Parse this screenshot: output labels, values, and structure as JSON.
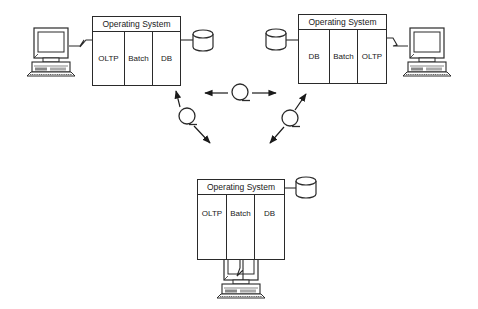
{
  "diagram": {
    "type": "distributed-systems-network",
    "nodes": [
      {
        "id": "node-top-left",
        "header": "Operating System",
        "columns": [
          "OLTP",
          "Batch",
          "DB"
        ]
      },
      {
        "id": "node-top-right",
        "header": "Operating System",
        "columns": [
          "DB",
          "Batch",
          "OLTP"
        ]
      },
      {
        "id": "node-bottom",
        "header": "Operating System",
        "columns": [
          "OLTP",
          "Batch",
          "DB"
        ]
      }
    ],
    "icons": {
      "terminal": "computer-terminal-icon",
      "database": "database-cylinder-icon",
      "network_link": "communication-loop-icon"
    },
    "connections": [
      {
        "from": "node-top-left",
        "to": "node-top-right",
        "style": "bidirectional-arrow-with-loop"
      },
      {
        "from": "node-top-left",
        "to": "node-bottom",
        "style": "bidirectional-arrow-with-loop"
      },
      {
        "from": "node-top-right",
        "to": "node-bottom",
        "style": "bidirectional-arrow-with-loop"
      }
    ],
    "colors": {
      "line": "#2a2a2a",
      "background": "#ffffff"
    }
  }
}
